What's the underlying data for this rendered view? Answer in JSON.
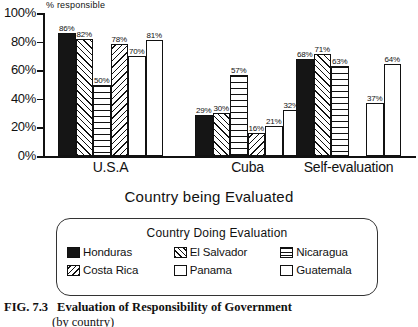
{
  "chart_data": {
    "type": "bar",
    "title": "",
    "ylabel": "% responsible",
    "xlabel": "Country  being Evaluated",
    "categories": [
      "U.S.A",
      "Cuba",
      "Self-evaluation"
    ],
    "ylim": [
      0,
      100
    ],
    "yticks": [
      "0%",
      "20%",
      "40%",
      "60%",
      "80%",
      "100%"
    ],
    "grid": false,
    "legend_title": "Country Doing Evaluation",
    "legend_position": "below-plot",
    "series": [
      {
        "name": "Honduras",
        "pattern": "solid",
        "values": [
          86,
          29,
          68
        ]
      },
      {
        "name": "El Salvador",
        "pattern": "fdiag",
        "values": [
          82,
          30,
          71
        ]
      },
      {
        "name": "Nicaragua",
        "pattern": "horiz",
        "values": [
          50,
          57,
          63
        ]
      },
      {
        "name": "Costa Rica",
        "pattern": "bdiag",
        "values": [
          78,
          16,
          null
        ]
      },
      {
        "name": "Panama",
        "pattern": "empty",
        "values": [
          70,
          21,
          37
        ]
      },
      {
        "name": "Guatemala",
        "pattern": "empty",
        "values": [
          81,
          32,
          64
        ]
      }
    ],
    "value_labels": [
      [
        "86%",
        "82%",
        "50%",
        "78%",
        "70%",
        "81%"
      ],
      [
        "29%",
        "30%",
        "57%",
        "16%",
        "21%",
        "32%"
      ],
      [
        "68%",
        "71%",
        "63%",
        "",
        "37%",
        "64%"
      ]
    ]
  },
  "caption": {
    "number": "FIG. 7.3",
    "text": "Evaluation of Responsibility of Government",
    "line2": "(by country)"
  }
}
